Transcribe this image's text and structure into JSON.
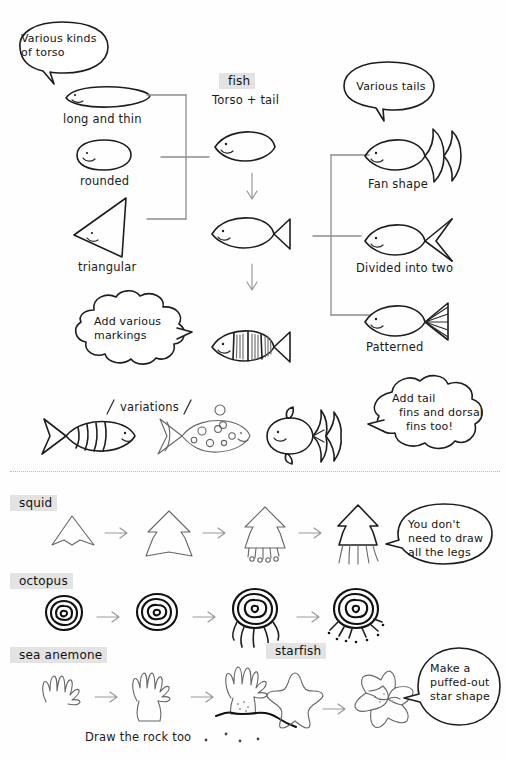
{
  "page": {
    "background_color": "#fefefe",
    "ink_color": "#1d1d1d",
    "highlight_color": "#e3e3e3",
    "connector_color": "#8d8d8d"
  },
  "fish_section": {
    "torso_bubble": {
      "line1": "Various kinds",
      "line2": "of torso"
    },
    "torso_examples": [
      {
        "label": "long and thin",
        "shape": "ellipse-long"
      },
      {
        "label": "rounded",
        "shape": "ellipse-round"
      },
      {
        "label": "triangular",
        "shape": "triangle"
      }
    ],
    "center_heading": "fish",
    "center_subheading": "Torso + tail",
    "markings_bubble": {
      "line1": "Add various",
      "line2": "markings"
    },
    "tails_bubble": {
      "line1": "Various tails"
    },
    "tail_examples": [
      {
        "label": "Fan shape"
      },
      {
        "label": "Divided into two"
      },
      {
        "label": "Patterned"
      }
    ],
    "fins_bubble": {
      "line1": "Add tail",
      "line2": "fins and dorsal",
      "line3": "fins too!"
    },
    "variations_label": "variations",
    "variations": [
      {
        "name": "striped-fish"
      },
      {
        "name": "spotted-fish"
      },
      {
        "name": "fancy-goldfish"
      }
    ]
  },
  "creatures_section": {
    "rows": [
      {
        "label": "squid",
        "steps": 4,
        "bubble": {
          "line1": "You don't",
          "line2": "need to draw",
          "line3": "all the legs"
        }
      },
      {
        "label": "octopus",
        "steps": 4,
        "bubble": null
      },
      {
        "label": "sea anemone",
        "steps": 3,
        "caption": "Draw the rock too",
        "bubble": null
      },
      {
        "label": "starfish",
        "steps": 2,
        "bubble": {
          "line1": "Make a",
          "line2": "puffed-out",
          "line3": "star shape"
        }
      }
    ]
  }
}
